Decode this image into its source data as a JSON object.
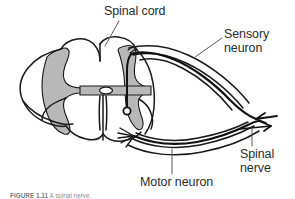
{
  "figure": {
    "domain": "anatomy-diagram",
    "background_color": "#ffffff",
    "line_color": "#1a1a1a",
    "gray_matter_color": "#b8b8b8",
    "label_color": "#2b2b2b"
  },
  "labels": {
    "spinal_cord": "Spinal cord",
    "sensory_neuron_line1": "Sensory",
    "sensory_neuron_line2": "neuron",
    "spinal_nerve_line1": "Spinal",
    "spinal_nerve_line2": "nerve",
    "motor_neuron": "Motor neuron"
  },
  "caption": {
    "number": "FIGURE 1.11",
    "text": "A spinal nerve."
  },
  "structures": {
    "gray_matter": "butterfly-shaped gray matter",
    "central_canal": "central canal",
    "ventral_median_fissure": "ventral median fissure",
    "dorsal_root": "dorsal root",
    "ventral_root": "ventral root",
    "dorsal_root_ganglion": "dorsal root ganglion",
    "sensory_cell_body": "sensory neuron synapse cell body",
    "ventral_rootlets": "ventral rootlets",
    "afferent_arrow": "left-pointing arrowhead",
    "efferent_arrow": "right-pointing arrowhead"
  }
}
